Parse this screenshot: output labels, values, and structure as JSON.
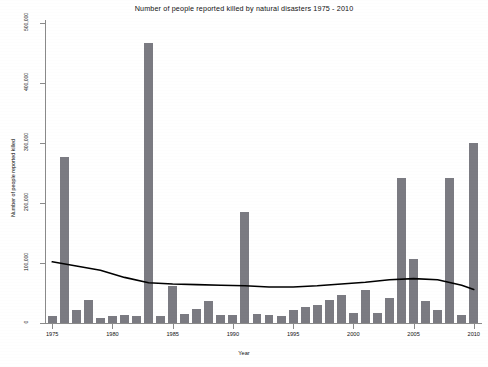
{
  "chart_data": {
    "type": "bar",
    "title": "Number of people reported killed by natural disasters 1975 - 2010",
    "xlabel": "Year",
    "ylabel": "Number of people reported killed",
    "xlim": [
      1974.4,
      2010.6
    ],
    "ylim": [
      0,
      500000
    ],
    "grid": false,
    "legend": "none",
    "bar_color": "#7b7b82",
    "trend_color": "#000000",
    "x_tick_labels": [
      "1975",
      "1980",
      "1985",
      "1990",
      "1995",
      "2000",
      "2005",
      "2010"
    ],
    "x_ticks": [
      1975,
      1980,
      1985,
      1990,
      1995,
      2000,
      2005,
      2010
    ],
    "y_tick_labels": [
      "0",
      "100,000",
      "200,000",
      "300,000",
      "400,000",
      "500,000"
    ],
    "y_ticks": [
      0,
      100000,
      200000,
      300000,
      400000,
      500000
    ],
    "categories": [
      1975,
      1976,
      1977,
      1978,
      1979,
      1980,
      1981,
      1982,
      1983,
      1984,
      1985,
      1986,
      1987,
      1988,
      1989,
      1990,
      1991,
      1992,
      1993,
      1994,
      1995,
      1996,
      1997,
      1998,
      1999,
      2000,
      2001,
      2002,
      2003,
      2004,
      2005,
      2006,
      2007,
      2008,
      2009,
      2010
    ],
    "values": [
      11000,
      277000,
      22000,
      38000,
      8000,
      11000,
      13000,
      12000,
      467000,
      12000,
      62000,
      15000,
      24000,
      37000,
      13000,
      13000,
      185000,
      15000,
      14000,
      12000,
      22000,
      26000,
      30000,
      38000,
      47000,
      16000,
      55000,
      16000,
      42000,
      242000,
      107000,
      37000,
      22000,
      242000,
      14000,
      300000
    ],
    "trend_series": {
      "name": "Smoothed trend",
      "x": [
        1975,
        1977,
        1979,
        1981,
        1983,
        1985,
        1987,
        1989,
        1991,
        1993,
        1995,
        1997,
        1999,
        2001,
        2003,
        2005,
        2007,
        2009,
        2010
      ],
      "y": [
        102000,
        95000,
        88000,
        76000,
        67000,
        65000,
        64000,
        63000,
        62000,
        60000,
        60000,
        62000,
        65000,
        68000,
        72000,
        74000,
        72000,
        63000,
        56000
      ]
    }
  }
}
